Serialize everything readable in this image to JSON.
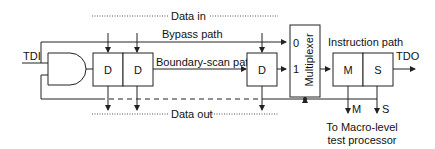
{
  "diagram": {
    "labels": {
      "data_in": "Data in",
      "data_out": "Data out",
      "bypass_path": "Bypass path",
      "boundary_scan_path": "Boundary-scan path",
      "instruction_path": "Instruction path",
      "tdi": "TDI",
      "tdo": "TDO",
      "mux_title": "Multiplexer",
      "mux_in0": "0",
      "mux_in1": "1",
      "m_out": "M",
      "s_out": "S",
      "macro_line1": "To Macro-level",
      "macro_line2": "test processor"
    },
    "registers": {
      "d1": "D",
      "d2": "D",
      "d3": "D",
      "m": "M",
      "s": "S"
    },
    "colors": {
      "line": "#222222",
      "background": "#ffffff"
    }
  }
}
